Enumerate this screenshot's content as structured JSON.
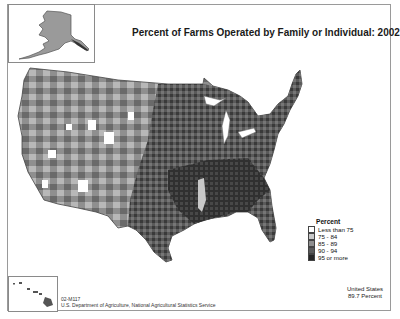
{
  "map": {
    "title": "Percent of Farms Operated by Family or Individual:  2002",
    "region": "United States (counties)",
    "insets": [
      "Alaska",
      "Hawaii"
    ]
  },
  "legend": {
    "title": "Percent",
    "items": [
      {
        "label": "Less than 75",
        "color": "#ffffff"
      },
      {
        "label": "75 - 84",
        "color": "#c8c8c8"
      },
      {
        "label": "85 - 89",
        "color": "#8f8f8f"
      },
      {
        "label": "90 - 94",
        "color": "#5a5a5a"
      },
      {
        "label": "95 or more",
        "color": "#262626"
      }
    ]
  },
  "summary": {
    "line1": "United States",
    "line2": "89.7 Percent"
  },
  "footer": {
    "code": "02-M117",
    "source": "U.S. Department of Agriculture, National Agricultural Statistics Service"
  }
}
